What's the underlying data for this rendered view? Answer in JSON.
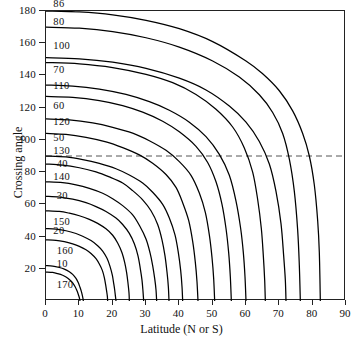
{
  "chart": {
    "title": "",
    "xlabel": "Latitude (N or S)",
    "ylabel": "Crossing angle"
  },
  "chart_data": {
    "type": "line",
    "title": "",
    "xlabel": "Latitude (N or S)",
    "ylabel": "Crossing angle",
    "xlim": [
      0,
      90
    ],
    "ylim": [
      0,
      180
    ],
    "xticks": [
      0,
      10,
      20,
      30,
      40,
      50,
      60,
      70,
      80,
      90
    ],
    "yticks": [
      0,
      20,
      40,
      60,
      80,
      100,
      120,
      140,
      160,
      180
    ],
    "xtick_labels": [
      "0",
      "10",
      "20",
      "30",
      "40",
      "50",
      "60",
      "70",
      "80",
      "90"
    ],
    "ytick_labels": [
      "0",
      "20",
      "40",
      "60",
      "80",
      "100",
      "120",
      "140",
      "160",
      "180"
    ],
    "grid": false,
    "legend": "none",
    "annotations": [
      {
        "text": "86",
        "x": 2.5,
        "y": 183,
        "series": "86"
      },
      {
        "text": "80",
        "x": 2.5,
        "y": 172,
        "series": "80/100"
      },
      {
        "text": "100",
        "x": 2.5,
        "y": 157,
        "series": "80/100"
      },
      {
        "text": "70",
        "x": 2.5,
        "y": 142,
        "series": "70/110"
      },
      {
        "text": "110",
        "x": 2.5,
        "y": 132,
        "series": "70/110"
      },
      {
        "text": "60",
        "x": 2.5,
        "y": 120,
        "series": "60/120"
      },
      {
        "text": "120",
        "x": 2.5,
        "y": 110,
        "series": "60/120"
      },
      {
        "text": "50",
        "x": 2.5,
        "y": 100,
        "series": "50/130"
      },
      {
        "text": "130",
        "x": 2.5,
        "y": 92,
        "series": "50/130"
      },
      {
        "text": "40",
        "x": 3.5,
        "y": 84,
        "series": "40/140"
      },
      {
        "text": "140",
        "x": 2.5,
        "y": 76,
        "series": "40/140"
      },
      {
        "text": "30",
        "x": 3.5,
        "y": 64,
        "series": "30/150"
      },
      {
        "text": "150",
        "x": 2.5,
        "y": 48,
        "series": "30/150"
      },
      {
        "text": "20",
        "x": 2.5,
        "y": 42,
        "series": "20/160"
      },
      {
        "text": "160",
        "x": 3.5,
        "y": 30,
        "series": "20/160"
      },
      {
        "text": "10",
        "x": 3.5,
        "y": 22,
        "series": "10/170"
      },
      {
        "text": "170",
        "x": 3.5,
        "y": 9,
        "series": "10/170"
      }
    ],
    "reference_lines": [
      {
        "orientation": "horizontal",
        "value": 90,
        "style": "dashed"
      }
    ],
    "series": [
      {
        "name": "86",
        "label": "86",
        "x": [
          0,
          10,
          20,
          30,
          40,
          50,
          60,
          65,
          70,
          74,
          77,
          79,
          80.5,
          81.5,
          82,
          82.3
        ],
        "values": [
          180,
          179.4,
          177.6,
          174.2,
          169,
          161,
          149,
          141,
          130.5,
          118,
          104,
          90,
          72,
          50,
          30,
          0
        ]
      },
      {
        "name": "80/100",
        "label": "80 / 100",
        "x": [
          0,
          10,
          20,
          30,
          40,
          50,
          58,
          64,
          68,
          71,
          73,
          74.5,
          75.5,
          76,
          76.3
        ],
        "values": [
          170,
          169.3,
          167.2,
          163.4,
          157.6,
          149,
          139,
          128,
          117,
          104,
          88,
          68,
          44,
          22,
          0
        ]
      },
      {
        "name": "80/100b",
        "label": "80 / 100",
        "x": [
          0,
          10,
          20,
          30,
          40,
          48,
          55,
          60,
          64,
          67,
          69,
          70.5,
          71.3,
          71.8,
          72
        ],
        "values": [
          151,
          150.3,
          148.2,
          144.4,
          138.3,
          131,
          121,
          111,
          99,
          85,
          68,
          48,
          28,
          13,
          0
        ]
      },
      {
        "name": "70/110",
        "label": "70 / 110",
        "x": [
          0,
          10,
          20,
          30,
          38,
          45,
          51,
          56,
          59.5,
          62,
          63.5,
          64.6,
          65.2,
          65.6,
          65.8
        ],
        "values": [
          148,
          147.2,
          144.9,
          140.7,
          135.5,
          128.2,
          119,
          108,
          95,
          80,
          63,
          45,
          28,
          13,
          0
        ]
      },
      {
        "name": "70/110b",
        "label": "70 / 110",
        "x": [
          0,
          8,
          16,
          24,
          31,
          37,
          43,
          48,
          52,
          55,
          57,
          58.4,
          59.2,
          59.7,
          60
        ],
        "values": [
          134,
          133.4,
          131.5,
          128.2,
          123.7,
          118.4,
          111,
          102,
          91,
          78,
          62,
          45,
          30,
          15,
          0
        ]
      },
      {
        "name": "60/120",
        "label": "60 / 120",
        "x": [
          0,
          8,
          16,
          23,
          29,
          35,
          40,
          45,
          48.5,
          51,
          52.8,
          54,
          54.8,
          55.3,
          55.6
        ],
        "values": [
          127,
          126.4,
          124.4,
          121.3,
          117.2,
          111.6,
          105,
          96,
          86,
          74,
          60,
          45,
          30,
          15,
          0
        ]
      },
      {
        "name": "60/120b",
        "label": "60 / 120",
        "x": [
          0,
          7,
          14,
          20,
          26,
          31,
          36,
          40,
          43.5,
          46,
          47.8,
          49,
          49.8,
          50.3,
          50.6
        ],
        "values": [
          113,
          112.4,
          110.5,
          107.8,
          104.2,
          99.5,
          93.5,
          86.5,
          78,
          67,
          55,
          41,
          27,
          14,
          0
        ]
      },
      {
        "name": "50/130",
        "label": "50 / 130",
        "x": [
          0,
          6,
          12,
          18,
          23,
          28,
          32,
          36,
          39,
          41,
          42.8,
          44,
          44.8,
          45.3,
          45.6
        ],
        "values": [
          104,
          103.4,
          101.6,
          98.8,
          95.2,
          90.7,
          85.5,
          78.5,
          70.5,
          61,
          50,
          37,
          24,
          12,
          0
        ]
      },
      {
        "name": "50/130b",
        "label": "50 / 130",
        "x": [
          0,
          6,
          11,
          16,
          21,
          25,
          29,
          32,
          35,
          37,
          38.7,
          39.7,
          40.4,
          40.8,
          41
        ],
        "values": [
          90,
          89.4,
          87.8,
          85.4,
          82.1,
          78.2,
          73.2,
          67.5,
          60,
          51.5,
          41,
          30,
          19,
          9,
          0
        ]
      },
      {
        "name": "40/140",
        "label": "40 / 140",
        "x": [
          0,
          5,
          10,
          15,
          19,
          23,
          26,
          29,
          31.5,
          33.5,
          34.8,
          35.7,
          36.3,
          36.7,
          36.9
        ],
        "values": [
          85,
          84.4,
          82.7,
          80.1,
          77,
          73.2,
          68.5,
          62.8,
          56,
          47.5,
          38,
          28,
          18,
          9,
          0
        ]
      },
      {
        "name": "40/140b",
        "label": "40 / 140",
        "x": [
          0,
          5,
          9,
          13,
          17,
          20,
          23,
          26,
          28,
          30,
          31.2,
          32,
          32.6,
          33,
          33.2
        ],
        "values": [
          74,
          73.5,
          72.1,
          69.9,
          66.9,
          63.5,
          59.2,
          53.5,
          47,
          38.5,
          30,
          22,
          14,
          7,
          0
        ]
      },
      {
        "name": "30/150",
        "label": "30 / 150",
        "x": [
          0,
          4,
          8,
          12,
          15,
          18,
          21,
          23,
          25,
          26.5,
          27.6,
          28.3,
          28.8,
          29.1,
          29.3
        ],
        "values": [
          65,
          64.5,
          63.2,
          61,
          58.6,
          55.6,
          51.5,
          47.5,
          42,
          35.5,
          28,
          20,
          13,
          6,
          0
        ]
      },
      {
        "name": "30/150b",
        "label": "30 / 150",
        "x": [
          0,
          4,
          7,
          10,
          13,
          15.5,
          18,
          20,
          21.5,
          22.8,
          23.6,
          24.2,
          24.6,
          24.9,
          25
        ],
        "values": [
          56,
          55.6,
          54.5,
          52.9,
          50.7,
          48.2,
          44.8,
          40.8,
          36,
          30,
          24,
          17.5,
          11,
          5,
          0
        ]
      },
      {
        "name": "20/160",
        "label": "20 / 160",
        "x": [
          0,
          3,
          6,
          9,
          11,
          13.5,
          15.5,
          17,
          18.3,
          19.2,
          19.9,
          20.3,
          20.6,
          20.8,
          21
        ],
        "values": [
          45,
          44.6,
          43.6,
          41.9,
          40.2,
          37.5,
          34.3,
          31,
          26.5,
          21.5,
          16,
          11,
          7,
          3.5,
          0
        ]
      },
      {
        "name": "20/160b",
        "label": "20 / 160",
        "x": [
          0,
          3,
          5.5,
          8,
          10,
          12,
          13.5,
          15,
          16,
          16.9,
          17.5,
          17.9,
          18.2,
          18.4,
          18.5
        ],
        "values": [
          38,
          37.7,
          36.8,
          35.4,
          33.9,
          31.8,
          29.5,
          26.3,
          23,
          19,
          14.5,
          10,
          6,
          3,
          0
        ]
      },
      {
        "name": "10/170",
        "label": "10 / 170",
        "x": [
          0,
          2,
          4,
          5.5,
          7,
          8,
          9,
          9.7,
          10.2,
          10.6,
          10.9,
          11.1,
          11.2
        ],
        "values": [
          22,
          21.7,
          20.8,
          19.8,
          18.2,
          16.5,
          14,
          11.3,
          8.5,
          6,
          3.5,
          1.5,
          0
        ]
      },
      {
        "name": "10/170b",
        "label": "10 / 170",
        "x": [
          0,
          2,
          3.5,
          5,
          6,
          7,
          8,
          8.7,
          9.2,
          9.6,
          9.9,
          10.1,
          10.2
        ],
        "values": [
          18,
          17.7,
          17,
          16,
          14.9,
          13.4,
          11.3,
          9,
          6.8,
          4.7,
          2.8,
          1.2,
          0
        ]
      }
    ]
  }
}
